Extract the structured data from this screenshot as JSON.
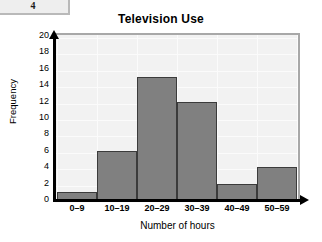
{
  "page_tab": {
    "number": "4"
  },
  "chart_data": {
    "type": "bar",
    "title": "Television Use",
    "xlabel": "Number of hours",
    "ylabel": "Frequency",
    "categories": [
      "0–9",
      "10–19",
      "20–29",
      "30–39",
      "40–49",
      "50–59"
    ],
    "values": [
      1,
      6,
      15,
      12,
      2,
      4
    ],
    "ylim": [
      0,
      20
    ],
    "ytick_step": 2,
    "yticks": [
      "0",
      "2",
      "4",
      "6",
      "8",
      "10",
      "12",
      "14",
      "16",
      "18",
      "20"
    ],
    "grid": true,
    "legend": null,
    "colors": {
      "bar_fill": "#808080",
      "bar_stroke": "#3b3b3b",
      "plot_background": "#f2f2f2",
      "axis": "#000000",
      "frame": "#a8a8a8"
    }
  }
}
